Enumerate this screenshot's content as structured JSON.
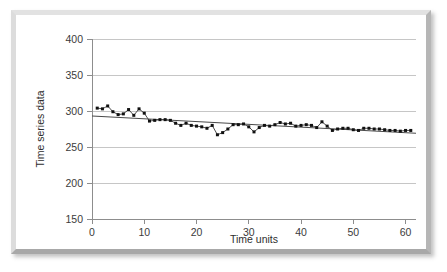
{
  "figure": {
    "frame_color": "#dcdcdc",
    "background_color": "#ffffff"
  },
  "chart_data": {
    "type": "scatter",
    "title": "",
    "subtitle": "",
    "xlabel": "Time units",
    "ylabel": "Time series data",
    "xlim": [
      0,
      62
    ],
    "ylim": [
      150,
      400
    ],
    "xticks": [
      0,
      10,
      20,
      30,
      40,
      50,
      60
    ],
    "yticks": [
      150,
      200,
      250,
      300,
      350,
      400
    ],
    "xtick_labels": [
      "0",
      "10",
      "20",
      "30",
      "40",
      "50",
      "60"
    ],
    "ytick_labels": [
      "150",
      "200",
      "250",
      "300",
      "350",
      "400"
    ],
    "grid": "horizontal",
    "legend": "none",
    "marker": "filled-square-with-connecting-line",
    "series": [
      {
        "name": "Time series data",
        "color": "#111111",
        "x": [
          1,
          2,
          3,
          4,
          5,
          6,
          7,
          8,
          9,
          10,
          11,
          12,
          13,
          14,
          15,
          16,
          17,
          18,
          19,
          20,
          21,
          22,
          23,
          24,
          25,
          26,
          27,
          28,
          29,
          30,
          31,
          32,
          33,
          34,
          35,
          36,
          37,
          38,
          39,
          40,
          41,
          42,
          43,
          44,
          45,
          46,
          47,
          48,
          49,
          50,
          51,
          52,
          53,
          54,
          55,
          56,
          57,
          58,
          59,
          60,
          61
        ],
        "values": [
          304,
          303,
          307,
          299,
          295,
          296,
          302,
          294,
          303,
          297,
          286,
          287,
          288,
          288,
          287,
          283,
          280,
          283,
          280,
          279,
          278,
          276,
          280,
          267,
          270,
          275,
          281,
          281,
          282,
          278,
          271,
          277,
          280,
          279,
          281,
          284,
          282,
          283,
          279,
          280,
          281,
          280,
          277,
          285,
          279,
          273,
          275,
          276,
          276,
          274,
          273,
          276,
          276,
          275,
          275,
          274,
          273,
          273,
          272,
          273,
          273
        ]
      }
    ],
    "trendline": {
      "name": "linear trend",
      "color": "#4a4a4a",
      "x_start": 0,
      "y_start": 293,
      "x_end": 62,
      "y_end": 269
    }
  }
}
